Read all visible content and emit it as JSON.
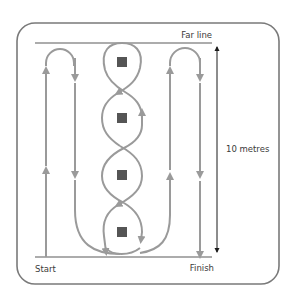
{
  "diagram": {
    "type": "drill-course",
    "labels": {
      "far_line": "Far line",
      "start": "Start",
      "finish": "Finish",
      "distance": "10 metres"
    },
    "colors": {
      "frame": "#7a7a7a",
      "path": "#9a9a9a",
      "line": "#5a5a5a",
      "marker": "#555555",
      "dimension_arrow": "#1a1a1a",
      "text": "#3a3a3a"
    },
    "markers": [
      {
        "name": "cone-1",
        "y": 62
      },
      {
        "name": "cone-2",
        "y": 118
      },
      {
        "name": "cone-3",
        "y": 175
      },
      {
        "name": "cone-4",
        "y": 232
      }
    ],
    "paths": [
      {
        "name": "left-shuttle",
        "description": "Run up from Start, turn at Far line, run back down"
      },
      {
        "name": "center-weave",
        "description": "Figure-of-eight weave around four cones"
      },
      {
        "name": "right-shuttle",
        "description": "Run up, turn at Far line, run down to Finish"
      }
    ]
  }
}
